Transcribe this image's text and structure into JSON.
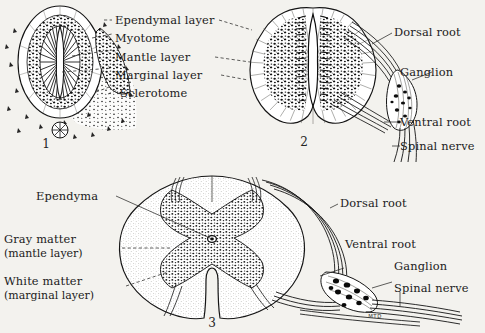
{
  "plate": {
    "title": "Development of the spinal cord",
    "background_color": "#f3f2ee",
    "ink_color": "#141414",
    "signature": "MTD"
  },
  "figures": [
    {
      "number": "1",
      "name": "early-neural-tube",
      "stage": "early embryonic spinal cord with surrounding mesenchyme"
    },
    {
      "number": "2",
      "name": "intermediate-cord",
      "stage": "intermediate spinal cord with spinal nerve and ganglion"
    },
    {
      "number": "3",
      "name": "mature-cord",
      "stage": "mature spinal cord with gray and white matter"
    }
  ],
  "labels": {
    "fig1": [
      {
        "id": "ependymal-layer",
        "text": "Ependymal layer"
      },
      {
        "id": "myotome",
        "text": "Myotome"
      },
      {
        "id": "mantle-layer",
        "text": "Mantle layer"
      },
      {
        "id": "marginal-layer",
        "text": "Marginal layer"
      },
      {
        "id": "sclerotome",
        "text": "Sclerotome"
      }
    ],
    "fig2": [
      {
        "id": "dorsal-root",
        "text": "Dorsal root"
      },
      {
        "id": "ganglion",
        "text": "Ganglion"
      },
      {
        "id": "ventral-root",
        "text": "Ventral root"
      },
      {
        "id": "spinal-nerve",
        "text": "Spinal nerve"
      }
    ],
    "fig3_left": [
      {
        "id": "ependyma",
        "text": "Ependyma",
        "sub": ""
      },
      {
        "id": "gray-matter",
        "text": "Gray matter",
        "sub": "(mantle layer)"
      },
      {
        "id": "white-matter",
        "text": "White matter",
        "sub": "(marginal layer)"
      }
    ],
    "fig3_right": [
      {
        "id": "dorsal-root",
        "text": "Dorsal root"
      },
      {
        "id": "ventral-root",
        "text": "Ventral root"
      },
      {
        "id": "ganglion",
        "text": "Ganglion"
      },
      {
        "id": "spinal-nerve",
        "text": "Spinal nerve"
      }
    ]
  }
}
